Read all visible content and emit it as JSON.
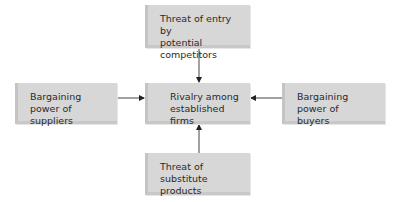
{
  "diagram": {
    "title": "",
    "nodes": {
      "top": {
        "label": "Threat of entry by\npotential competitors"
      },
      "left": {
        "label": "Bargaining power of\nsuppliers"
      },
      "center": {
        "label": "Rivalry among\nestablished firms"
      },
      "right": {
        "label": "Bargaining power of\nbuyers"
      },
      "bottom": {
        "label": "Threat of substitute\nproducts"
      }
    },
    "edges": [
      {
        "from": "top",
        "to": "center"
      },
      {
        "from": "left",
        "to": "center"
      },
      {
        "from": "right",
        "to": "center"
      },
      {
        "from": "bottom",
        "to": "center"
      }
    ],
    "colors": {
      "box": "#d7d7d7",
      "line": "#333333",
      "text": "#2a2a2a"
    }
  }
}
